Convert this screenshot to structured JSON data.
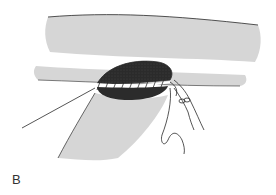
{
  "figure": {
    "panel_label": "B",
    "colors": {
      "ink": "#2a2a2a",
      "hatch": "#8a8a8a",
      "lumen": "#2b2b2b",
      "background": "#ffffff"
    }
  }
}
